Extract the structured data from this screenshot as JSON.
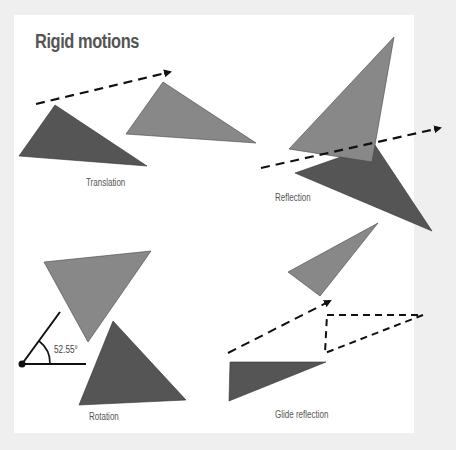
{
  "title": "Rigid motions",
  "colors": {
    "background": "#efefef",
    "card": "#ffffff",
    "dark_triangle": "#555555",
    "light_triangle": "#888888",
    "line": "#111111",
    "text": "#555555"
  },
  "panels": [
    {
      "id": "translation",
      "label": "Translation"
    },
    {
      "id": "reflection",
      "label": "Reflection"
    },
    {
      "id": "rotation",
      "label": "Rotation",
      "angle_label": "52.55°"
    },
    {
      "id": "glide-reflection",
      "label": "Glide reflection"
    }
  ],
  "shapes": {
    "translation": {
      "dark": "19,156 55,105 147,166",
      "light": "126,134 163,82 256,143",
      "arrow": {
        "x1": 36,
        "y1": 104,
        "x2": 170,
        "y2": 72
      }
    },
    "reflection": {
      "light": "289,149 394,37 372,162",
      "dark": "295,173 375,145 432,231",
      "line": {
        "x1": 261,
        "y1": 168,
        "x2": 440,
        "y2": 128
      }
    },
    "rotation": {
      "light": "44,262 151,251 88,342",
      "dark": "79,405 113,321 186,400",
      "vertex": {
        "x": 22,
        "y": 364
      },
      "ray1": {
        "x2": 86,
        "y2": 364
      },
      "ray2": {
        "x2": 60,
        "y2": 312
      }
    },
    "glide": {
      "light": "288,272 378,223 320,296",
      "arrow": {
        "x1": 228,
        "y1": 353,
        "x2": 330,
        "y2": 301
      },
      "outline": "327,315 423,315 325,353",
      "dark": "230,362 326,362 229,401"
    }
  }
}
